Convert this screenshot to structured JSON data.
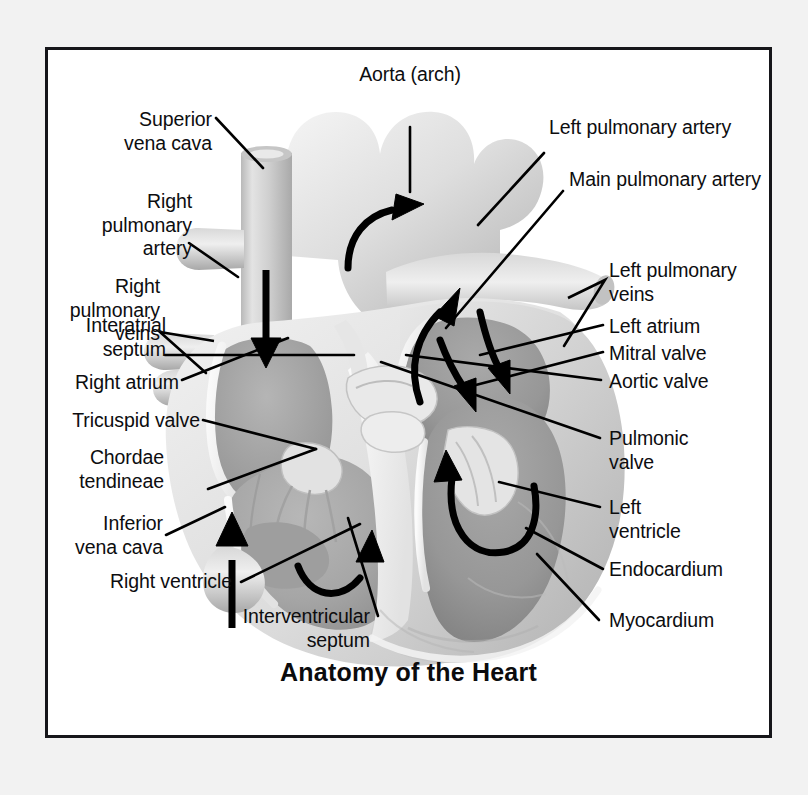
{
  "figure": {
    "title": "Anatomy of the Heart",
    "frame_border_color": "#16161a",
    "page_background": "#f2f2f2",
    "panel_background": "#ffffff",
    "label_color": "#0d0d0f",
    "leader_line_color": "#000000",
    "illustration_subject": "human-heart-coronal-cross-section",
    "illustration_style": "grayscale-shaded-anatomical-drawing"
  },
  "labels": {
    "superior_vena_cava": "Superior\nvena cava",
    "right_pulmonary_artery": "Right\npulmonary\nartery",
    "right_pulmonary_veins": "Right\npulmonary\nveins",
    "interatrial_septum": "Interatrial\nseptum",
    "right_atrium": "Right atrium",
    "tricuspid_valve": "Tricuspid valve",
    "chordae_tendineae": "Chordae\ntendineae",
    "inferior_vena_cava": "Inferior\nvena cava",
    "right_ventricle": "Right ventricle",
    "interventricular_septum": "Interventricular\nseptum",
    "aorta_arch": "Aorta (arch)",
    "left_pulmonary_artery": "Left pulmonary artery",
    "main_pulmonary_artery": "Main pulmonary artery",
    "left_pulmonary_veins": "Left pulmonary\nveins",
    "left_atrium": "Left atrium",
    "mitral_valve": "Mitral valve",
    "aortic_valve": "Aortic valve",
    "pulmonic_valve": "Pulmonic\nvalve",
    "left_ventricle": "Left\nventricle",
    "endocardium": "Endocardium",
    "myocardium": "Myocardium"
  },
  "flow_arrows": [
    {
      "name": "svc-inflow-down",
      "description": "downward arrow in superior vena cava into right atrium"
    },
    {
      "name": "aortic-arch-outflow",
      "description": "curved arrow up and right through aortic arch"
    },
    {
      "name": "rv-outflow-up",
      "description": "curved arrow up through pulmonary outflow tract"
    },
    {
      "name": "pulmonary-vein-inflow",
      "description": "double arrows down into left atrium"
    },
    {
      "name": "lv-filling-loop",
      "description": "curved loop arrow in left ventricle"
    },
    {
      "name": "rv-filling-loop",
      "description": "curved loop arrow in right ventricle"
    },
    {
      "name": "ivc-inflow-up",
      "description": "upward arrow in inferior vena cava into right atrium"
    }
  ]
}
